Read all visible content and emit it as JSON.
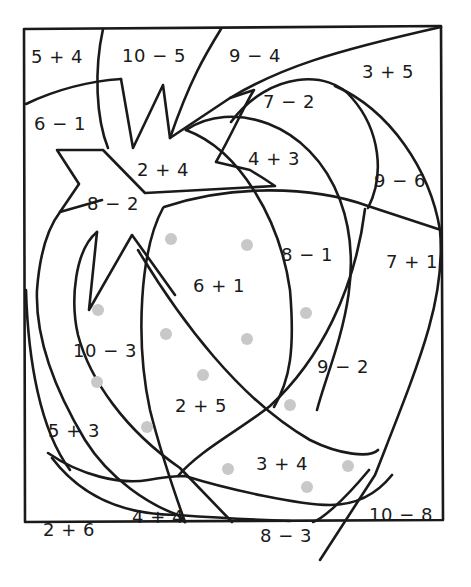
{
  "worksheet": {
    "subject": "strawberry color-by-number",
    "line_color": "#1a1a1a",
    "seed_color": "#c8c8c8",
    "regions": [
      {
        "id": "r1",
        "expr": "5 + 4",
        "x": 57,
        "y": 56
      },
      {
        "id": "r2",
        "expr": "10 − 5",
        "x": 154,
        "y": 55
      },
      {
        "id": "r3",
        "expr": "9 − 4",
        "x": 255,
        "y": 55
      },
      {
        "id": "r4",
        "expr": "3 + 5",
        "x": 388,
        "y": 71
      },
      {
        "id": "r5",
        "expr": "6 − 1",
        "x": 60,
        "y": 123
      },
      {
        "id": "r6",
        "expr": "7 − 2",
        "x": 289,
        "y": 101
      },
      {
        "id": "r7",
        "expr": "2 + 4",
        "x": 163,
        "y": 169
      },
      {
        "id": "r8",
        "expr": "4 + 3",
        "x": 274,
        "y": 158
      },
      {
        "id": "r9",
        "expr": "9 − 6",
        "x": 400,
        "y": 180
      },
      {
        "id": "r10",
        "expr": "8 − 2",
        "x": 113,
        "y": 203
      },
      {
        "id": "r11",
        "expr": "8 − 1",
        "x": 307,
        "y": 254
      },
      {
        "id": "r12",
        "expr": "7 + 1",
        "x": 412,
        "y": 261
      },
      {
        "id": "r13",
        "expr": "6 + 1",
        "x": 219,
        "y": 285
      },
      {
        "id": "r14",
        "expr": "10 − 3",
        "x": 105,
        "y": 350
      },
      {
        "id": "r15",
        "expr": "9 − 2",
        "x": 343,
        "y": 366
      },
      {
        "id": "r16",
        "expr": "2 + 5",
        "x": 201,
        "y": 405
      },
      {
        "id": "r17",
        "expr": "5 + 3",
        "x": 74,
        "y": 430
      },
      {
        "id": "r18",
        "expr": "3 + 4",
        "x": 282,
        "y": 463
      },
      {
        "id": "r19",
        "expr": "10 − 8",
        "x": 401,
        "y": 514
      },
      {
        "id": "r20",
        "expr": "4 + 4",
        "x": 158,
        "y": 516
      },
      {
        "id": "r21",
        "expr": "2 + 6",
        "x": 69,
        "y": 529
      },
      {
        "id": "r22",
        "expr": "8 − 3",
        "x": 286,
        "y": 535
      }
    ],
    "seeds": [
      [
        171,
        239
      ],
      [
        247,
        245
      ],
      [
        98,
        310
      ],
      [
        166,
        334
      ],
      [
        247,
        339
      ],
      [
        306,
        313
      ],
      [
        97,
        382
      ],
      [
        203,
        375
      ],
      [
        147,
        427
      ],
      [
        290,
        405
      ],
      [
        228,
        469
      ],
      [
        348,
        466
      ],
      [
        307,
        487
      ]
    ]
  }
}
